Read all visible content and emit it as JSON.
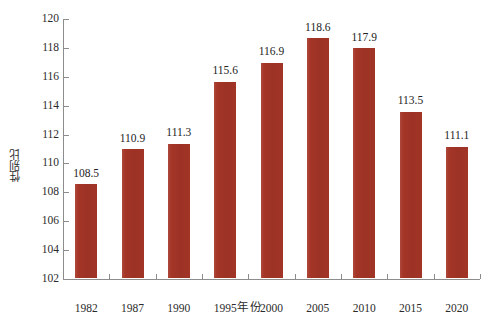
{
  "chart_data": {
    "type": "bar",
    "title": "",
    "subtitle": "",
    "xlabel": "年  份",
    "ylabel": "性别比",
    "categories": [
      "1982",
      "1987",
      "1990",
      "1995",
      "2000",
      "2005",
      "2010",
      "2015",
      "2020"
    ],
    "values": [
      108.5,
      110.9,
      111.3,
      115.6,
      116.9,
      118.6,
      117.9,
      113.5,
      111.1
    ],
    "value_labels": [
      "108.5",
      "110.9",
      "111.3",
      "115.6",
      "116.9",
      "118.6",
      "117.9",
      "113.5",
      "111.1"
    ],
    "ylim": [
      102,
      120
    ],
    "ytick_labels": [
      "102",
      "104",
      "106",
      "108",
      "110",
      "112",
      "114",
      "116",
      "118",
      "120"
    ],
    "ytick_values": [
      102,
      104,
      106,
      108,
      110,
      112,
      114,
      116,
      118,
      120
    ],
    "grid": false,
    "legend": null,
    "legend_position": "none",
    "bar_color": "#a43527",
    "axis_color": "#8d8d8d",
    "text_color": "#2b2b2b",
    "background": "#ffffff"
  }
}
